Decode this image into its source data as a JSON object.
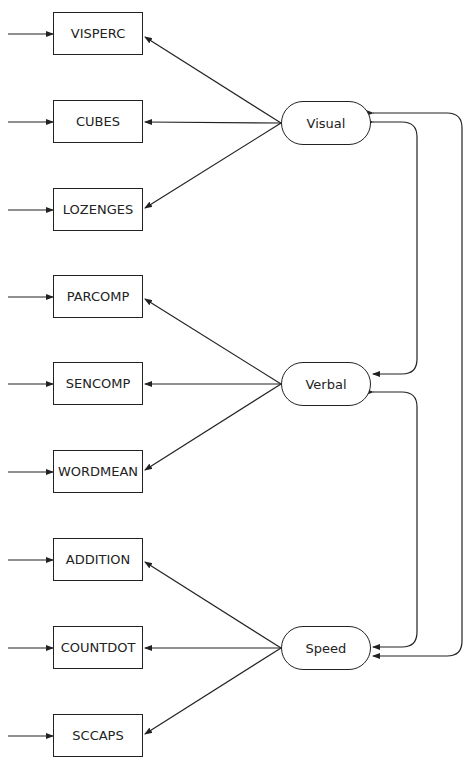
{
  "diagram": {
    "type": "path-diagram",
    "factors": [
      {
        "id": "visual",
        "label": "Visual",
        "indicators": [
          "VISPERC",
          "CUBES",
          "LOZENGES"
        ]
      },
      {
        "id": "verbal",
        "label": "Verbal",
        "indicators": [
          "PARCOMP",
          "SENCOMP",
          "WORDMEAN"
        ]
      },
      {
        "id": "speed",
        "label": "Speed",
        "indicators": [
          "ADDITION",
          "COUNTDOT",
          "SCCAPS"
        ]
      }
    ],
    "indicators": [
      {
        "label": "VISPERC"
      },
      {
        "label": "CUBES"
      },
      {
        "label": "LOZENGES"
      },
      {
        "label": "PARCOMP"
      },
      {
        "label": "SENCOMP"
      },
      {
        "label": "WORDMEAN"
      },
      {
        "label": "ADDITION"
      },
      {
        "label": "COUNTDOT"
      },
      {
        "label": "SCCAPS"
      }
    ],
    "covariances": [
      {
        "from": "Visual",
        "to": "Verbal"
      },
      {
        "from": "Verbal",
        "to": "Speed"
      },
      {
        "from": "Visual",
        "to": "Speed"
      }
    ],
    "colors": {
      "line": "#222222",
      "background": "#ffffff"
    }
  }
}
